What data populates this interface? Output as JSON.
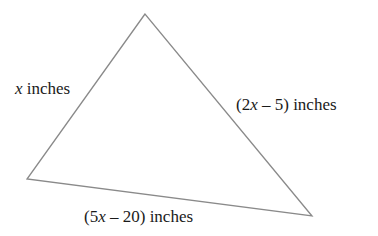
{
  "diagram": {
    "type": "triangle",
    "stroke_color": "#8a8a8a",
    "vertices": {
      "top": [
        145,
        14
      ],
      "left": [
        27,
        179
      ],
      "right": [
        312,
        216
      ]
    },
    "sides": {
      "left": {
        "variable": "x",
        "expr_prefix": "",
        "expr_suffix": "",
        "unit": " inches",
        "full_text": "x inches"
      },
      "right": {
        "expr_prefix": "(2",
        "variable": "x",
        "expr_suffix": " – 5)",
        "unit": " inches",
        "full_text": "(2x – 5) inches"
      },
      "bottom": {
        "expr_prefix": "(5",
        "variable": "x",
        "expr_suffix": " – 20)",
        "unit": " inches",
        "full_text": "(5x – 20) inches"
      }
    }
  }
}
